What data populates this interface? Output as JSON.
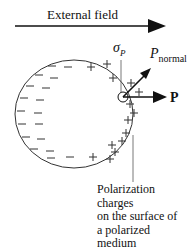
{
  "diagram": {
    "external_field_label": "External field",
    "sigma_label": "σ",
    "sigma_sub": "P",
    "p_normal_label": "P",
    "p_normal_sub": "normal",
    "p_label": "P",
    "caption_lines": [
      "Polarization",
      "charges",
      "on the surface of",
      "a polarized",
      "medium"
    ],
    "negative_charge_symbol": "−",
    "positive_charge_symbol": "+",
    "colors": {
      "line": "#222222",
      "background": "#ffffff"
    }
  }
}
